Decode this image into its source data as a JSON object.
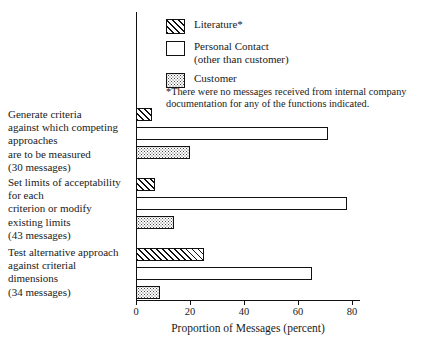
{
  "chart_data": {
    "type": "bar",
    "orientation": "horizontal",
    "title": "",
    "xlabel": "Proportion of Messages (percent)",
    "ylabel": "",
    "xlim": [
      0,
      83
    ],
    "xticks": [
      0,
      20,
      40,
      60,
      80
    ],
    "grid": false,
    "legend_position": "top-right-inside",
    "categories": [
      "Generate criteria against which competing approaches are to be measured (30 messages)",
      "Set limits of acceptability for each criterion or modify existing limits (43 messages)",
      "Test alternative approach against criterial dimensions (34 messages)"
    ],
    "category_lines": [
      [
        "Generate criteria",
        "against which competing",
        "approaches",
        "are to be measured",
        "(30 messages)"
      ],
      [
        "Set limits of acceptability",
        "for each",
        "criterion or modify",
        "existing limits",
        "(43 messages)"
      ],
      [
        "Test alternative approach",
        "against criterial",
        "dimensions",
        "(34 messages)"
      ]
    ],
    "category_message_counts": [
      30,
      43,
      34
    ],
    "series": [
      {
        "name": "Literature*",
        "values": [
          6,
          7,
          25
        ],
        "pattern": "diagonal-hatch"
      },
      {
        "name": "Personal Contact (other than customer)",
        "values": [
          71,
          78,
          65
        ],
        "pattern": "empty"
      },
      {
        "name": "Customer",
        "values": [
          20,
          14,
          9
        ],
        "pattern": "stipple-dots"
      }
    ],
    "annotations": [
      "*There were no messages received from internal company documentation for any of the functions indicated."
    ]
  },
  "legend": {
    "items": [
      {
        "label": "Literature*",
        "sublabel": "",
        "swatch": "literature"
      },
      {
        "label": "Personal Contact",
        "sublabel": "(other than customer)",
        "swatch": "personal"
      },
      {
        "label": "Customer",
        "sublabel": "",
        "swatch": "customer"
      }
    ]
  },
  "footnote": {
    "text": "*There were no messages received from internal company documentation for any of the functions indicated."
  },
  "axis": {
    "x_title": "Proportion of Messages (percent)",
    "tick_labels": [
      "0",
      "20",
      "40",
      "60",
      "80"
    ]
  },
  "colors": {
    "ink": "#111111",
    "background": "#ffffff",
    "stipple": "#4a4a4a"
  }
}
